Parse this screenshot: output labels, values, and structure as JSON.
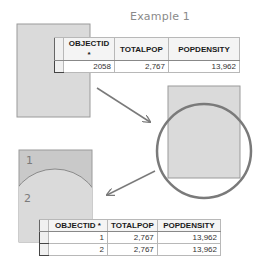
{
  "title": "Example 1",
  "colors": {
    "polygon_fill": "#dadada",
    "polygon_fill_dark": "#c9c9c9",
    "polygon_stroke": "#9a9a9a",
    "circle_stroke": "#7a7a7a",
    "arrow": "#7a7a7a"
  },
  "polygon_labels": {
    "part1": "1",
    "part2": "2"
  },
  "table_before": {
    "headers": [
      "OBJECTID *",
      "TOTALPOP",
      "POPDENSITY"
    ],
    "rows": [
      [
        "2058",
        "2,767",
        "13,962"
      ]
    ]
  },
  "table_after": {
    "headers": [
      "OBJECTID *",
      "TOTALPOP",
      "POPDENSITY"
    ],
    "rows": [
      [
        "1",
        "2,767",
        "13,962"
      ],
      [
        "2",
        "2,767",
        "13,962"
      ]
    ]
  }
}
